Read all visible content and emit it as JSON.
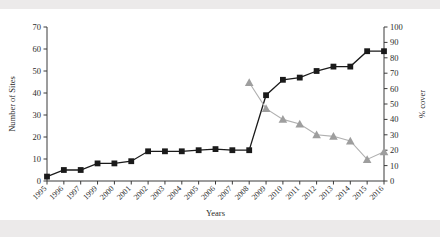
{
  "chart_data": {
    "type": "line",
    "title": "",
    "xlabel": "Years",
    "categories": [
      "1995",
      "1996",
      "1997",
      "1999",
      "2000",
      "2001",
      "2002",
      "2003",
      "2004",
      "2005",
      "2006",
      "2007",
      "2008",
      "2009",
      "2010",
      "2011",
      "2012",
      "2013",
      "2014",
      "2015",
      "2016"
    ],
    "grid": false,
    "legend": "none",
    "axes": {
      "left": {
        "label": "Number of Sites",
        "min": 0,
        "max": 70,
        "step": 10,
        "ticks": [
          "0",
          "10",
          "20",
          "30",
          "40",
          "50",
          "60",
          "70"
        ]
      },
      "right": {
        "label": "% cover",
        "min": 0,
        "max": 100,
        "step": 10,
        "ticks": [
          "0",
          "10",
          "20",
          "30",
          "40",
          "50",
          "60",
          "70",
          "80",
          "90",
          "100"
        ]
      },
      "x": {
        "label": "Years",
        "tick_rotation": -45,
        "note": "1998 is absent from the tick sequence"
      }
    },
    "series": [
      {
        "name": "Number of Sites",
        "axis": "left",
        "marker": "square",
        "color": "#1a1a1a",
        "line_color": "#1a1a1a",
        "x": [
          "1995",
          "1996",
          "1997",
          "1999",
          "2000",
          "2001",
          "2002",
          "2003",
          "2004",
          "2005",
          "2006",
          "2007",
          "2008",
          "2009",
          "2010",
          "2011",
          "2012",
          "2013",
          "2014",
          "2015",
          "2016"
        ],
        "values": [
          2,
          5,
          5,
          8,
          8,
          9,
          13.5,
          13.5,
          13.5,
          14,
          14.5,
          14,
          14,
          39,
          46,
          47,
          50,
          52,
          52,
          59,
          59
        ]
      },
      {
        "name": "% cover",
        "axis": "right",
        "marker": "triangle",
        "color": "#9e9e9e",
        "line_color": "#b0b0b0",
        "x": [
          "2008",
          "2009",
          "2010",
          "2011",
          "2012",
          "2013",
          "2014",
          "2015",
          "2016"
        ],
        "values": [
          64,
          47,
          40,
          37,
          30,
          29,
          26,
          14,
          19
        ]
      }
    ]
  }
}
